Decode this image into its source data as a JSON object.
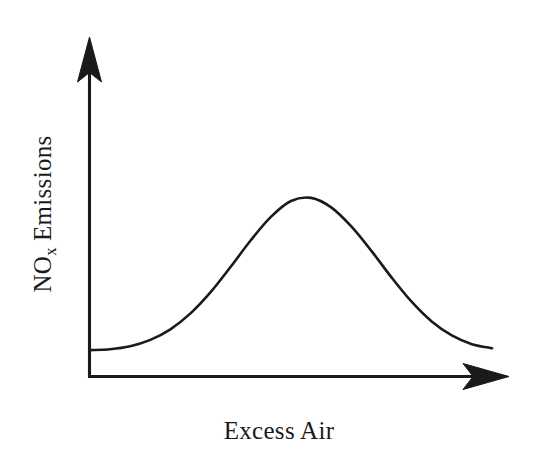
{
  "figure": {
    "background_color": "#ffffff",
    "ink_color": "#1a1a1a",
    "style": "hand-drawn schematic line sketch, no tick marks, no gridlines, no numeric scale"
  },
  "labels": {
    "y_axis_main": "NO",
    "y_axis_subscript": "x",
    "y_axis_tail": " Emissions",
    "y_axis_full": "NOx Emissions",
    "x_axis": "Excess Air"
  },
  "axes": {
    "x": {
      "label": "Excess Air",
      "arrow": "right",
      "has_ticks": false,
      "has_numbers": false,
      "origin_px": [
        89,
        377
      ],
      "tip_px": [
        508,
        377
      ]
    },
    "y": {
      "label": "NOx Emissions",
      "arrow": "up",
      "has_ticks": false,
      "has_numbers": false,
      "origin_px": [
        89,
        377
      ],
      "tip_px": [
        89,
        38
      ]
    }
  },
  "chart_data": {
    "type": "line",
    "title": "",
    "subtitle": "",
    "xlabel": "Excess Air",
    "ylabel": "NOx Emissions",
    "xlim": [
      0,
      1
    ],
    "ylim": [
      0,
      1
    ],
    "grid": false,
    "legend": null,
    "annotations": [],
    "series": [
      {
        "name": "NOx Emissions vs Excess Air",
        "color": "#1a1a1a",
        "x": [
          0.0,
          0.05,
          0.1,
          0.15,
          0.2,
          0.25,
          0.3,
          0.35,
          0.4,
          0.45,
          0.5,
          0.55,
          0.6,
          0.65,
          0.7,
          0.75,
          0.8,
          0.85,
          0.9,
          0.95,
          1.0
        ],
        "y": [
          0.127,
          0.131,
          0.145,
          0.175,
          0.225,
          0.3,
          0.4,
          0.52,
          0.645,
          0.755,
          0.83,
          0.845,
          0.8,
          0.71,
          0.595,
          0.47,
          0.355,
          0.262,
          0.196,
          0.155,
          0.136
        ]
      }
    ],
    "peak": {
      "x": 0.455,
      "y": 0.848,
      "pixel": [
        280,
        186
      ]
    },
    "start_point": {
      "x": 0.0,
      "y": 0.127,
      "pixel": [
        90,
        334
      ]
    },
    "end_point": {
      "x": 1.0,
      "y": 0.136,
      "pixel": [
        492,
        331
      ]
    }
  }
}
